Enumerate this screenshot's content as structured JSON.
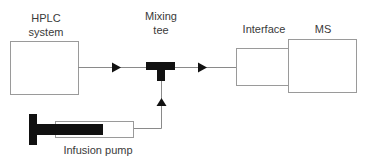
{
  "diagram": {
    "type": "flow-schematic",
    "nodes": {
      "hplc": {
        "line1": "HPLC",
        "line2": "system"
      },
      "mixing_tee": {
        "line1": "Mixing",
        "line2": "tee"
      },
      "interface": {
        "label": "Interface"
      },
      "ms": {
        "label": "MS"
      },
      "infusion_pump": {
        "label": "Infusion pump"
      }
    },
    "edges": [
      {
        "from": "HPLC system",
        "to": "Mixing tee"
      },
      {
        "from": "Mixing tee",
        "to": "Interface"
      },
      {
        "from": "Infusion pump",
        "to": "Mixing tee"
      }
    ],
    "colors": {
      "box_stroke": "#9a9a9a",
      "line": "#8a8a8a",
      "fill_dark": "#111111",
      "text": "#3a3a3a"
    }
  }
}
